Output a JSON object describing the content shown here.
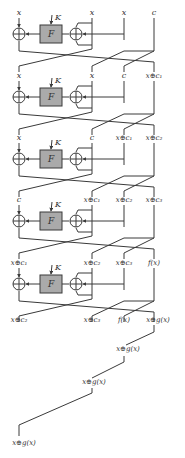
{
  "diagram": {
    "type": "cipher-round-network",
    "colors": {
      "line": "#3a3a3a",
      "box_fill": "#aaaaaa",
      "box_stroke": "#3a3a3a",
      "label": "#333333"
    },
    "function_label": "F",
    "key_label": "K",
    "rounds": [
      {
        "inputs": [
          "x",
          "x",
          "x",
          "c"
        ]
      },
      {
        "inputs": [
          "x",
          "x",
          "c",
          "x⊕c₁"
        ]
      },
      {
        "inputs": [
          "x",
          "c",
          "x⊕c₁",
          "x⊕c₂"
        ]
      },
      {
        "inputs": [
          "c",
          "x⊕c₁",
          "x⊕c₂",
          "x⊕c₃"
        ]
      },
      {
        "inputs": [
          "x⊕c₁",
          "x⊕c₂",
          "x⊕c₃",
          "f(x)"
        ]
      }
    ],
    "final_outputs": [
      "x⊕c₂",
      "x⊕c₃",
      "f(x)",
      "x⊕g(x)"
    ],
    "trail_labels": [
      "x⊕g(x)",
      "x⊕g(x)",
      "x⊕g(x)"
    ]
  }
}
